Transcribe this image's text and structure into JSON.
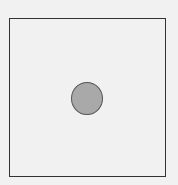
{
  "diagram": {
    "frame": {
      "shape": "square",
      "stroke": "#333333",
      "fill": "#f1f1f1"
    },
    "center_marker": {
      "shape": "circle",
      "fill": "#a9a9a9",
      "pattern": "stippled",
      "stroke": "#555555"
    }
  }
}
